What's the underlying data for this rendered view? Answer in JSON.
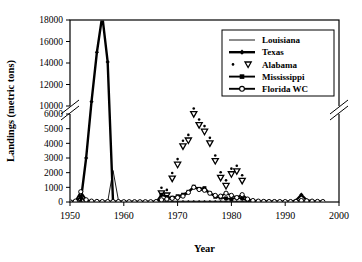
{
  "chart_data": {
    "type": "line",
    "title": "",
    "xlabel": "Year",
    "ylabel": "Landings (metric tons)",
    "xlim": [
      1950,
      2000
    ],
    "xticks": [
      1950,
      1960,
      1970,
      1980,
      1990,
      2000
    ],
    "xticklabels": [
      "1950",
      "1960",
      "1970",
      "1980",
      "1990",
      "2000"
    ],
    "yticks_lower": [
      0,
      1000,
      2000,
      3000,
      4000,
      5000,
      6000
    ],
    "yticklabels_lower": [
      "0",
      "1000",
      "2000",
      "3000",
      "4000",
      "5000",
      "6000"
    ],
    "yticks_upper": [
      10000,
      12000,
      14000,
      16000,
      18000
    ],
    "yticklabels_upper": [
      "10000",
      "12000",
      "14000",
      "16000",
      "18000"
    ],
    "axis_break": {
      "lower_max": 6000,
      "upper_min": 10000,
      "note": "broken y-axis between 6000 and 10000"
    },
    "grid": false,
    "legend_position": "upper right",
    "series": [
      {
        "name": "Louisiana",
        "marker": "none",
        "style": "thin-line",
        "x": [
          1950,
          1951,
          1952,
          1953,
          1954,
          1955,
          1956,
          1957,
          1958,
          1959,
          1960,
          1961,
          1962,
          1963,
          1964,
          1965,
          1966,
          1967,
          1968,
          1969,
          1970,
          1971,
          1972,
          1973,
          1974,
          1975,
          1976,
          1977,
          1978,
          1979,
          1980,
          1981,
          1982,
          1983,
          1984,
          1985,
          1986,
          1987,
          1988,
          1989,
          1990,
          1991,
          1992,
          1993,
          1994,
          1995,
          1996,
          1997
        ],
        "values": [
          0,
          0,
          0,
          0,
          0,
          0,
          0,
          0,
          2150,
          120,
          0,
          0,
          0,
          0,
          0,
          0,
          0,
          0,
          0,
          0,
          0,
          0,
          0,
          0,
          0,
          0,
          0,
          0,
          0,
          0,
          0,
          0,
          0,
          0,
          0,
          0,
          0,
          0,
          0,
          0,
          0,
          0,
          0,
          0,
          0,
          0,
          0,
          0
        ]
      },
      {
        "name": "Texas",
        "marker": "filled-diamond",
        "style": "thick-line",
        "x": [
          1950,
          1951,
          1952,
          1953,
          1954,
          1955,
          1956,
          1957,
          1958,
          1959,
          1960,
          1961,
          1962,
          1963,
          1964,
          1965,
          1966,
          1967,
          1968,
          1969,
          1970,
          1971,
          1972,
          1973,
          1974,
          1975,
          1976,
          1977,
          1978,
          1979,
          1980,
          1981,
          1982,
          1983,
          1984,
          1985,
          1986,
          1987,
          1988,
          1989,
          1990,
          1991,
          1992,
          1993,
          1994,
          1995,
          1996,
          1997
        ],
        "values": [
          0,
          0,
          50,
          3000,
          10400,
          15000,
          18400,
          14100,
          0,
          0,
          0,
          0,
          0,
          0,
          0,
          0,
          0,
          0,
          0,
          0,
          0,
          0,
          0,
          0,
          0,
          0,
          0,
          0,
          0,
          0,
          0,
          0,
          0,
          0,
          0,
          0,
          0,
          0,
          0,
          0,
          0,
          0,
          100,
          500,
          120,
          60,
          30,
          20
        ]
      },
      {
        "name": "Alabama",
        "marker": "dot-and-open-triangle-down",
        "style": "markers-only",
        "x": [
          1967,
          1968,
          1969,
          1970,
          1971,
          1972,
          1973,
          1974,
          1975,
          1976,
          1977,
          1978,
          1979,
          1980,
          1981,
          1982
        ],
        "values": [
          600,
          450,
          1600,
          2550,
          3800,
          4200,
          6000,
          5250,
          4800,
          4000,
          2800,
          1650,
          1100,
          1900,
          2100,
          1450
        ]
      },
      {
        "name": "Mississippi",
        "marker": "filled-square",
        "style": "thick-line",
        "x": [
          1950,
          1951,
          1952,
          1953,
          1954,
          1955,
          1956,
          1957,
          1958,
          1959,
          1960,
          1961,
          1962,
          1963,
          1964,
          1965,
          1966,
          1967,
          1968,
          1969,
          1970,
          1971,
          1972,
          1973,
          1974,
          1975,
          1976,
          1977,
          1978,
          1979,
          1980,
          1981,
          1982,
          1983,
          1984,
          1985,
          1986,
          1987,
          1988,
          1989,
          1990,
          1991,
          1992,
          1993,
          1994,
          1995,
          1996,
          1997
        ],
        "values": [
          0,
          0,
          350,
          0,
          0,
          0,
          0,
          0,
          0,
          0,
          0,
          0,
          0,
          0,
          0,
          0,
          0,
          500,
          350,
          300,
          400,
          500,
          700,
          1050,
          900,
          950,
          600,
          350,
          300,
          250,
          200,
          300,
          250,
          100,
          60,
          40,
          30,
          20,
          20,
          10,
          10,
          10,
          10,
          10,
          10,
          10,
          10,
          10
        ]
      },
      {
        "name": "Florida WC",
        "marker": "open-circle",
        "style": "line-with-open-circles",
        "x": [
          1950,
          1951,
          1952,
          1953,
          1954,
          1955,
          1956,
          1957,
          1958,
          1959,
          1960,
          1961,
          1962,
          1963,
          1964,
          1965,
          1966,
          1967,
          1968,
          1969,
          1970,
          1971,
          1972,
          1973,
          1974,
          1975,
          1976,
          1977,
          1978,
          1979,
          1980,
          1981,
          1982,
          1983,
          1984,
          1985,
          1986,
          1987,
          1988,
          1989,
          1990,
          1991,
          1992,
          1993,
          1994,
          1995,
          1996,
          1997
        ],
        "values": [
          30,
          60,
          700,
          150,
          60,
          40,
          30,
          30,
          30,
          30,
          20,
          20,
          20,
          20,
          20,
          20,
          30,
          150,
          200,
          250,
          300,
          400,
          650,
          1000,
          850,
          800,
          600,
          450,
          400,
          600,
          450,
          300,
          500,
          200,
          100,
          60,
          40,
          30,
          30,
          30,
          30,
          30,
          40,
          100,
          80,
          60,
          40,
          30
        ]
      }
    ]
  },
  "legend": {
    "items": [
      {
        "label": "Louisiana"
      },
      {
        "label": "Texas"
      },
      {
        "label": "Alabama"
      },
      {
        "label": "Mississippi"
      },
      {
        "label": "Florida WC"
      }
    ]
  }
}
